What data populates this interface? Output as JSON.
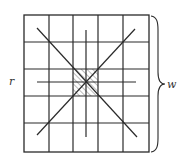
{
  "diagram": {
    "type": "grid-with-diagonals",
    "grid": {
      "rows": 5,
      "cols": 5,
      "hatched_cell": {
        "row": 2,
        "col": 2
      }
    },
    "labels": {
      "left": "r",
      "right": "w"
    },
    "colors": {
      "line": "#2a2a2a",
      "background": "#ffffff",
      "hatch": "#555555"
    }
  }
}
